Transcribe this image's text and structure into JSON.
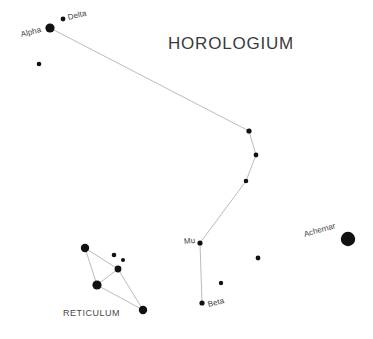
{
  "chart": {
    "kind": "star-chart",
    "width": 373,
    "height": 339,
    "background_color": "#ffffff",
    "star_color": "#111111",
    "line_color": "#b3b3b3",
    "label_color": "#3f3f3f",
    "title_color": "#3a3a3a"
  },
  "titles": {
    "horologium": "HOROLOGIUM",
    "reticulum": "RETICULUM"
  },
  "star_labels": {
    "alpha": "Alpha",
    "delta": "Delta",
    "mu": "Mu",
    "beta": "Beta",
    "achernar": "Achernar"
  },
  "chart_data": {
    "type": "scatter",
    "title": "HOROLOGIUM",
    "xlabel": "",
    "ylabel": "",
    "xlim": [
      0,
      373
    ],
    "ylim": [
      0,
      339
    ],
    "grid": false,
    "legend": "none",
    "annotations": [
      {
        "text": "HOROLOGIUM",
        "x": 168,
        "y": 45,
        "role": "constellation-title"
      },
      {
        "text": "RETICULUM",
        "x": 63,
        "y": 317,
        "role": "constellation-title-small"
      }
    ],
    "stars": [
      {
        "id": "hor-alpha",
        "label": "Alpha",
        "x": 50,
        "y": 28,
        "r": 4.6,
        "constellation": "Horologium"
      },
      {
        "id": "hor-delta",
        "label": "Delta",
        "x": 63,
        "y": 19,
        "r": 2.4,
        "constellation": "Horologium"
      },
      {
        "id": "hor-s3",
        "label": "",
        "x": 39,
        "y": 64,
        "r": 2.3,
        "constellation": "Horologium"
      },
      {
        "id": "hor-s4",
        "label": "",
        "x": 249,
        "y": 131,
        "r": 2.6,
        "constellation": "Horologium"
      },
      {
        "id": "hor-s5",
        "label": "",
        "x": 256,
        "y": 155,
        "r": 2.4,
        "constellation": "Horologium"
      },
      {
        "id": "hor-s6",
        "label": "",
        "x": 246,
        "y": 181,
        "r": 2.3,
        "constellation": "Horologium"
      },
      {
        "id": "hor-mu",
        "label": "Mu",
        "x": 200,
        "y": 243,
        "r": 2.6,
        "constellation": "Horologium"
      },
      {
        "id": "hor-beta",
        "label": "Beta",
        "x": 202,
        "y": 303,
        "r": 2.6,
        "constellation": "Horologium"
      },
      {
        "id": "hor-s9",
        "label": "",
        "x": 258,
        "y": 258,
        "r": 2.4,
        "constellation": "Horologium"
      },
      {
        "id": "hor-s10",
        "label": "",
        "x": 221,
        "y": 283,
        "r": 2.2,
        "constellation": "Horologium"
      },
      {
        "id": "eri-achernar",
        "label": "Achernar",
        "x": 348,
        "y": 239,
        "r": 7.2,
        "constellation": "Eridanus"
      },
      {
        "id": "ret-s1",
        "label": "",
        "x": 85,
        "y": 248,
        "r": 4.2,
        "constellation": "Reticulum"
      },
      {
        "id": "ret-s2",
        "label": "",
        "x": 114,
        "y": 255,
        "r": 2.3,
        "constellation": "Reticulum"
      },
      {
        "id": "ret-s3",
        "label": "",
        "x": 123,
        "y": 260,
        "r": 2.0,
        "constellation": "Reticulum"
      },
      {
        "id": "ret-s4",
        "label": "",
        "x": 118,
        "y": 269,
        "r": 3.4,
        "constellation": "Reticulum"
      },
      {
        "id": "ret-s5",
        "label": "",
        "x": 97,
        "y": 285,
        "r": 4.6,
        "constellation": "Reticulum"
      },
      {
        "id": "ret-s6",
        "label": "",
        "x": 143,
        "y": 310,
        "r": 4.2,
        "constellation": "Reticulum"
      }
    ],
    "lines": [
      {
        "from": "hor-alpha",
        "to": "hor-s4"
      },
      {
        "from": "hor-s4",
        "to": "hor-s5"
      },
      {
        "from": "hor-s5",
        "to": "hor-s6"
      },
      {
        "from": "hor-s6",
        "to": "hor-mu"
      },
      {
        "from": "hor-mu",
        "to": "hor-beta"
      },
      {
        "from": "ret-s1",
        "to": "ret-s4"
      },
      {
        "from": "ret-s1",
        "to": "ret-s5"
      },
      {
        "from": "ret-s4",
        "to": "ret-s5"
      },
      {
        "from": "ret-s4",
        "to": "ret-s6"
      },
      {
        "from": "ret-s5",
        "to": "ret-s6"
      }
    ]
  }
}
